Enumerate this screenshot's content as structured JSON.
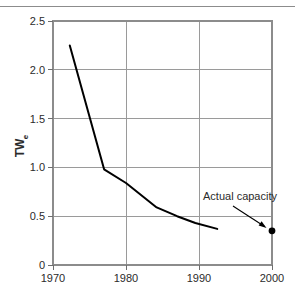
{
  "chart_data": {
    "type": "line",
    "title": "",
    "xlabel": "",
    "ylabel": "TWe",
    "ylabel_base": "TW",
    "ylabel_sub": "e",
    "xlim": [
      1970,
      2000
    ],
    "ylim": [
      0,
      2.5
    ],
    "grid": true,
    "legend": null,
    "xticks": [
      "1970",
      "1980",
      "1990",
      "2000"
    ],
    "xtick_values": [
      1970,
      1980,
      1990,
      2000
    ],
    "yticks": [
      "0",
      "0.5",
      "1.0",
      "1.5",
      "2.0",
      "2.5"
    ],
    "ytick_values": [
      0,
      0.5,
      1.0,
      1.5,
      2.0,
      2.5
    ],
    "series": [
      {
        "name": "Projected capacity",
        "type": "line",
        "x": [
          1972.3,
          1977.0,
          1980.0,
          1984.2,
          1987.0,
          1989.5,
          1992.5
        ],
        "values": [
          2.25,
          0.98,
          0.84,
          0.59,
          0.5,
          0.43,
          0.37
        ]
      },
      {
        "name": "Actual capacity",
        "type": "scatter",
        "x": [
          2000
        ],
        "values": [
          0.35
        ]
      }
    ],
    "annotations": [
      {
        "text": "Actual capacity",
        "x": 2000,
        "y": 0.35,
        "label_x": 1992.0,
        "label_y": 0.72
      }
    ]
  },
  "colors": {
    "series_line": "#000000",
    "datapoint": "#000000",
    "gridline": "#9a9a9a",
    "frame": "#8c8c8c",
    "text": "#2b2b2b",
    "background": "#ffffff"
  }
}
